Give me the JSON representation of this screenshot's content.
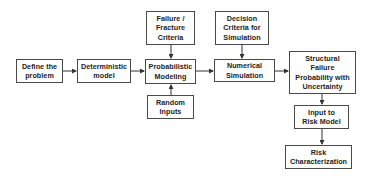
{
  "diagram": {
    "type": "flowchart",
    "nodes": [
      {
        "id": "define",
        "label": "Define the\nproblem",
        "x": 16,
        "y": 59,
        "w": 47,
        "h": 24
      },
      {
        "id": "deterministic",
        "label": "Deterministic\nmodel",
        "x": 77,
        "y": 59,
        "w": 54,
        "h": 24
      },
      {
        "id": "probabilistic",
        "label": "Probabilistic\nModeling",
        "x": 145,
        "y": 59,
        "w": 51,
        "h": 25
      },
      {
        "id": "failure",
        "label": "Failure /\nFracture\nCriteria",
        "x": 146,
        "y": 11,
        "w": 49,
        "h": 34
      },
      {
        "id": "random",
        "label": "Random\nInputs",
        "x": 147,
        "y": 95,
        "w": 47,
        "h": 24
      },
      {
        "id": "decision",
        "label": "Decision\nCriteria for\nSimulation",
        "x": 215,
        "y": 11,
        "w": 54,
        "h": 34
      },
      {
        "id": "numerical",
        "label": "Numerical\nSimulation",
        "x": 214,
        "y": 59,
        "w": 61,
        "h": 23
      },
      {
        "id": "structural",
        "label": "Structural\nFailure\nProbability with\nUncertainty",
        "x": 289,
        "y": 51,
        "w": 67,
        "h": 43
      },
      {
        "id": "input_risk",
        "label": "Input to\nRisk Model",
        "x": 294,
        "y": 105,
        "w": 55,
        "h": 24
      },
      {
        "id": "risk_char",
        "label": "Risk\nCharacterization",
        "x": 285,
        "y": 145,
        "w": 67,
        "h": 24
      }
    ],
    "edges": [
      {
        "from": "define",
        "to": "deterministic"
      },
      {
        "from": "deterministic",
        "to": "probabilistic"
      },
      {
        "from": "failure",
        "to": "probabilistic"
      },
      {
        "from": "random",
        "to": "probabilistic"
      },
      {
        "from": "probabilistic",
        "to": "numerical"
      },
      {
        "from": "decision",
        "to": "numerical"
      },
      {
        "from": "numerical",
        "to": "structural"
      },
      {
        "from": "structural",
        "to": "input_risk"
      },
      {
        "from": "input_risk",
        "to": "risk_char"
      }
    ]
  }
}
